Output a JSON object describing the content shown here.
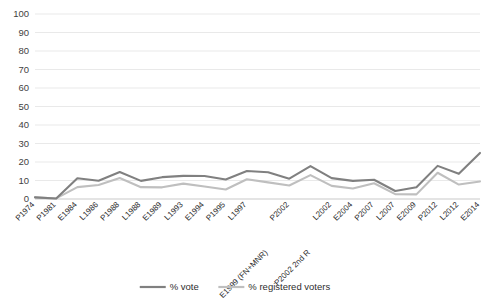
{
  "chart_data": {
    "type": "line",
    "title": "",
    "xlabel": "",
    "ylabel": "",
    "ylim": [
      0,
      100
    ],
    "yticks": [
      0,
      10,
      20,
      30,
      40,
      50,
      60,
      70,
      80,
      90,
      100
    ],
    "grid": true,
    "legend_position": "bottom",
    "categories": [
      "P1974",
      "P1981",
      "E1984",
      "L1986",
      "P1988",
      "L1988",
      "E1989",
      "L1993",
      "E1994",
      "P1995",
      "L1997",
      "E1999 (FN+MNR)",
      "P2002",
      "P2002 2nd R",
      "L2002",
      "E2004",
      "P2007",
      "L2007",
      "E2009",
      "P2012",
      "L2012",
      "E2014"
    ],
    "series": [
      {
        "name": "% vote",
        "color": "#808080",
        "values": [
          0.9,
          0.3,
          11.2,
          9.9,
          14.6,
          9.8,
          11.8,
          12.5,
          12.4,
          10.5,
          15.1,
          14.5,
          11.0,
          17.8,
          11.3,
          9.8,
          10.4,
          4.3,
          6.3,
          17.9,
          13.6,
          24.9
        ]
      },
      {
        "name": "% registered voters",
        "color": "#bfbfbf",
        "values": [
          0.9,
          0.3,
          6.4,
          7.6,
          11.3,
          6.4,
          6.3,
          8.3,
          6.8,
          5.1,
          10.7,
          9.0,
          7.3,
          12.9,
          7.1,
          5.7,
          8.5,
          2.6,
          2.5,
          14.2,
          7.8,
          9.5
        ]
      }
    ]
  },
  "legend": {
    "items": [
      {
        "label": "% vote",
        "color": "#808080"
      },
      {
        "label": "% registered voters",
        "color": "#bfbfbf"
      }
    ]
  }
}
